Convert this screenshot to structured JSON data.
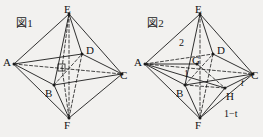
{
  "page": {
    "background_color": "#f2f1ef",
    "ink_color": "#131313",
    "width": 263,
    "height": 137
  },
  "figures": [
    {
      "id": "figure-1",
      "caption": "図1",
      "shape": "octahedron",
      "vertex_labels": [
        {
          "name": "E",
          "text": "E",
          "x": 64,
          "y": 4
        },
        {
          "name": "D",
          "text": "D",
          "x": 86,
          "y": 45
        },
        {
          "name": "A",
          "text": "A",
          "x": 3,
          "y": 57
        },
        {
          "name": "C",
          "text": "C",
          "x": 120,
          "y": 70
        },
        {
          "name": "B",
          "text": "B",
          "x": 45,
          "y": 88
        },
        {
          "name": "F",
          "text": "F",
          "x": 64,
          "y": 120
        }
      ],
      "measure_labels": []
    },
    {
      "id": "figure-2",
      "caption": "図2",
      "shape": "octahedron",
      "vertex_labels": [
        {
          "name": "E",
          "text": "E",
          "x": 64,
          "y": 4
        },
        {
          "name": "D",
          "text": "D",
          "x": 86,
          "y": 45
        },
        {
          "name": "A",
          "text": "A",
          "x": 3,
          "y": 57
        },
        {
          "name": "G",
          "text": "G",
          "x": 61,
          "y": 58
        },
        {
          "name": "C",
          "text": "C",
          "x": 120,
          "y": 70
        },
        {
          "name": "B",
          "text": "B",
          "x": 45,
          "y": 88
        },
        {
          "name": "H",
          "text": "H",
          "x": 97,
          "y": 91
        },
        {
          "name": "F",
          "text": "F",
          "x": 64,
          "y": 120
        }
      ],
      "measure_labels": [
        {
          "name": "segment-length-2",
          "text": "2",
          "italic": false,
          "x": 48,
          "y": 38
        },
        {
          "name": "segment-length-1",
          "text": "1",
          "italic": false,
          "x": 53,
          "y": 69
        },
        {
          "name": "segment-length-t",
          "text": "t",
          "italic": true,
          "x": 110,
          "y": 80
        },
        {
          "name": "segment-length-1-minus-t",
          "text": "1−t",
          "italic": false,
          "x": 93,
          "y": 110
        }
      ]
    }
  ]
}
